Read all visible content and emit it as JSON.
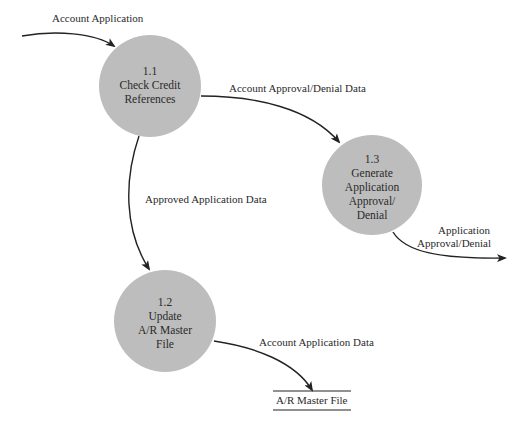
{
  "diagram": {
    "type": "data-flow-diagram",
    "colors": {
      "process_fill": "#bdbdbd",
      "line": "#222222",
      "text": "#2a2a2a",
      "background": "#ffffff"
    },
    "processes": [
      {
        "id": "1.1",
        "number": "1.1",
        "lines": [
          "Check Credit",
          "References"
        ]
      },
      {
        "id": "1.2",
        "number": "1.2",
        "lines": [
          "Update",
          "A/R Master",
          "File"
        ]
      },
      {
        "id": "1.3",
        "number": "1.3",
        "lines": [
          "Generate",
          "Application",
          "Approval/",
          "Denial"
        ]
      }
    ],
    "data_stores": [
      {
        "id": "ar-master-file",
        "label": "A/R Master File"
      }
    ],
    "flows": [
      {
        "from": "external",
        "to": "1.1",
        "label": "Account Application"
      },
      {
        "from": "1.1",
        "to": "1.3",
        "label": "Account Approval/Denial Data"
      },
      {
        "from": "1.1",
        "to": "1.2",
        "label": "Approved Application Data"
      },
      {
        "from": "1.3",
        "to": "external",
        "label_lines": [
          "Application",
          "Approval/Denial"
        ]
      },
      {
        "from": "1.2",
        "to": "ar-master-file",
        "label": "Account Application Data"
      }
    ]
  }
}
